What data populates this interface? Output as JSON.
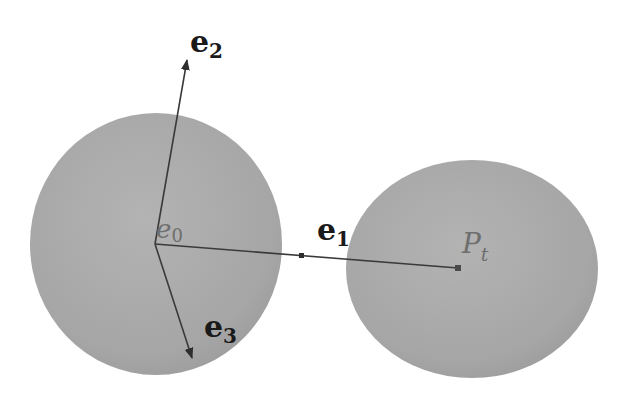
{
  "diagram": {
    "colors": {
      "sphere_fill": "#a9a9a9",
      "sphere_edge": "#9a9a9a",
      "axis_line": "#3a3a3a",
      "label_bold": "#1a1a1a",
      "label_faint": "#6e6e6e",
      "background": "#ffffff"
    },
    "spheres": [
      {
        "name": "left-sphere",
        "cx": 156,
        "cy": 244,
        "rx": 126,
        "ry": 131
      },
      {
        "name": "right-sphere",
        "cx": 472,
        "cy": 269,
        "rx": 126,
        "ry": 109
      }
    ],
    "origin": {
      "x": 155,
      "y": 244
    },
    "vectors": [
      {
        "name": "e2",
        "to": {
          "x": 187,
          "y": 58
        },
        "arrow": true
      },
      {
        "name": "e1",
        "to": {
          "x": 458,
          "y": 268
        },
        "arrow": false
      },
      {
        "name": "e3",
        "to": {
          "x": 193,
          "y": 360
        },
        "arrow": true
      }
    ],
    "labels": {
      "e2": {
        "main": "e",
        "sub": "2"
      },
      "e1": {
        "main": "e",
        "sub": "1"
      },
      "e3": {
        "main": "e",
        "sub": "3"
      },
      "e0": {
        "main": "e",
        "sub": "0"
      },
      "pt": {
        "main": "P",
        "sub": "t"
      }
    }
  }
}
